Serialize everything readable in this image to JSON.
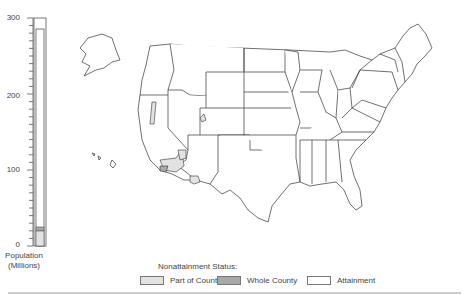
{
  "chart_data": {
    "type": "bar",
    "title": "",
    "xlabel": "",
    "ylabel": "Population (Millions)",
    "ylim": [
      0,
      300
    ],
    "yticks": [
      0,
      100,
      200,
      300
    ],
    "minor_tick_step": 10,
    "categories": [
      "Population"
    ],
    "series": [
      {
        "name": "Part of County",
        "values": [
          20
        ]
      },
      {
        "name": "Whole County",
        "values": [
          5
        ]
      },
      {
        "name": "Attainment",
        "values": [
          260
        ]
      }
    ],
    "total": 285
  },
  "axis": {
    "labels": [
      "300",
      "200",
      "100",
      "0"
    ]
  },
  "caption": {
    "line1": "Population",
    "line2": "(Millions)"
  },
  "legend": {
    "title": "Nonattainment Status:",
    "items": [
      {
        "label": "Part of County",
        "color": "#e2e2e2"
      },
      {
        "label": "Whole County",
        "color": "#a8a8a8"
      },
      {
        "label": "Attainment",
        "color": "#ffffff"
      }
    ]
  },
  "map": {
    "title": "United States counties nonattainment map",
    "highlighted_regions": [
      "Southern California",
      "Southern Nevada",
      "Phoenix area Arizona",
      "Salt Lake area Utah",
      "Western Nevada strip"
    ]
  }
}
